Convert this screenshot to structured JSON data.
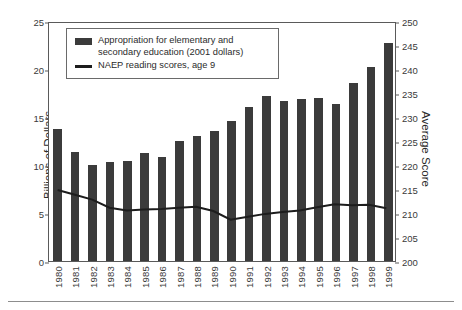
{
  "chart_data": {
    "type": "bar",
    "title": "",
    "xlabel": "",
    "ylabel": "Billions of Dollars",
    "y2label": "Average Score",
    "ylim": [
      0,
      25
    ],
    "y2lim": [
      200,
      250
    ],
    "yticks": [
      0,
      5,
      10,
      15,
      20,
      25
    ],
    "y2ticks": [
      200,
      205,
      210,
      215,
      220,
      225,
      230,
      235,
      240,
      245,
      250
    ],
    "grid": false,
    "legend_position": "upper-left",
    "categories": [
      "1980",
      "1981",
      "1982",
      "1983",
      "1984",
      "1985",
      "1986",
      "1987",
      "1988",
      "1989",
      "1990",
      "1991",
      "1992",
      "1993",
      "1994",
      "1995",
      "1996",
      "1997",
      "1998",
      "1999"
    ],
    "series": [
      {
        "name": "Appropriation for elementary and secondary education (2001 dollars)",
        "type": "bar",
        "axis": "left",
        "unit": "Billions of Dollars",
        "color": "#3b3b3b",
        "values": [
          13.7,
          11.4,
          10.0,
          10.3,
          10.4,
          11.2,
          10.8,
          12.5,
          13.0,
          13.5,
          14.6,
          16.0,
          17.2,
          16.7,
          16.9,
          17.0,
          16.4,
          18.5,
          20.2,
          22.7
        ]
      },
      {
        "name": "NAEP reading scores, age 9",
        "type": "line",
        "axis": "right",
        "unit": "Average Score",
        "color": "#1d1d1d",
        "values": [
          215.0,
          214.0,
          213.0,
          211.3,
          210.7,
          210.9,
          211.0,
          211.3,
          211.5,
          210.6,
          208.8,
          209.4,
          210.0,
          210.4,
          210.7,
          211.4,
          212.0,
          211.8,
          211.9,
          211.2
        ]
      }
    ]
  },
  "legend": {
    "items": [
      {
        "marker": "bar-swatch",
        "label": "Appropriation for elementary and secondary education (2001 dollars)"
      },
      {
        "marker": "line-swatch",
        "label": "NAEP reading scores, age 9"
      }
    ]
  },
  "axes": {
    "left_title": "Billions of Dollars",
    "right_title": "Average Score"
  }
}
